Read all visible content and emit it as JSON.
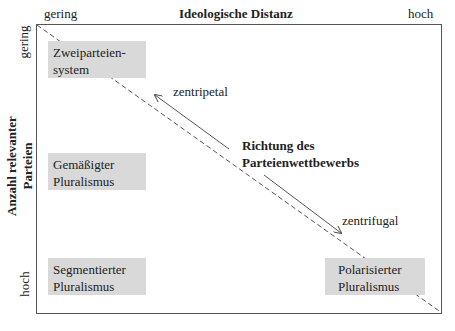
{
  "x_axis": {
    "title": "Ideologische Distanz",
    "low_label": "gering",
    "high_label": "hoch"
  },
  "y_axis": {
    "title_line1": "Anzahl relevanter",
    "title_line2": "Parteien",
    "low_label": "gering",
    "high_label": "hoch"
  },
  "boxes": [
    {
      "line1": "Zweiparteien-",
      "line2": "system"
    },
    {
      "line1": "Gemäßigter",
      "line2": "Pluralismus"
    },
    {
      "line1": "Segmentierter",
      "line2": "Pluralismus"
    },
    {
      "line1": "Polarisierter",
      "line2": "Pluralismus"
    }
  ],
  "center_label": {
    "line1": "Richtung des",
    "line2": "Parteienwettbewerbs"
  },
  "arrows": {
    "up_label": "zentripetal",
    "down_label": "zentrifugal"
  },
  "colors": {
    "box_fill": "#d9d9d9",
    "line": "#555555"
  }
}
